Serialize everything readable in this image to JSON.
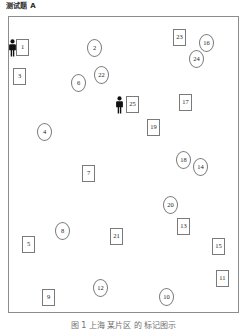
{
  "figure": {
    "title": "测试题 A",
    "caption": "图 1  上海 某片区 的 标记图示",
    "panel": {
      "border_color": "#8d8d8d",
      "background": "#ffffff"
    }
  },
  "persons": [
    {
      "name": "person-left",
      "x": 8,
      "y": 39
    },
    {
      "name": "person-center",
      "x": 115,
      "y": 96
    }
  ],
  "markers": [
    {
      "id": 1,
      "label": "1",
      "shape": "square",
      "x": 16,
      "y": 39
    },
    {
      "id": 2,
      "label": "2",
      "shape": "circle",
      "x": 87,
      "y": 39
    },
    {
      "id": 3,
      "label": "3",
      "shape": "square",
      "x": 13,
      "y": 68
    },
    {
      "id": 4,
      "label": "4",
      "shape": "circle",
      "x": 37,
      "y": 123
    },
    {
      "id": 5,
      "label": "5",
      "shape": "square",
      "x": 22,
      "y": 236
    },
    {
      "id": 6,
      "label": "6",
      "shape": "circle",
      "x": 71,
      "y": 74
    },
    {
      "id": 7,
      "label": "7",
      "shape": "square",
      "x": 82,
      "y": 165
    },
    {
      "id": 8,
      "label": "8",
      "shape": "circle",
      "x": 55,
      "y": 222
    },
    {
      "id": 9,
      "label": "9",
      "shape": "square",
      "x": 42,
      "y": 289
    },
    {
      "id": 10,
      "label": "10",
      "shape": "circle",
      "x": 159,
      "y": 288
    },
    {
      "id": 11,
      "label": "11",
      "shape": "square",
      "x": 216,
      "y": 270
    },
    {
      "id": 12,
      "label": "12",
      "shape": "circle",
      "x": 93,
      "y": 279
    },
    {
      "id": 13,
      "label": "13",
      "shape": "square",
      "x": 177,
      "y": 218
    },
    {
      "id": 14,
      "label": "14",
      "shape": "circle",
      "x": 193,
      "y": 158
    },
    {
      "id": 15,
      "label": "15",
      "shape": "square",
      "x": 212,
      "y": 238
    },
    {
      "id": 16,
      "label": "16",
      "shape": "circle",
      "x": 199,
      "y": 34
    },
    {
      "id": 17,
      "label": "17",
      "shape": "square",
      "x": 179,
      "y": 94
    },
    {
      "id": 18,
      "label": "18",
      "shape": "circle",
      "x": 176,
      "y": 151
    },
    {
      "id": 19,
      "label": "19",
      "shape": "square",
      "x": 147,
      "y": 119
    },
    {
      "id": 20,
      "label": "20",
      "shape": "circle",
      "x": 163,
      "y": 196
    },
    {
      "id": 21,
      "label": "21",
      "shape": "square",
      "x": 110,
      "y": 228
    },
    {
      "id": 22,
      "label": "22",
      "shape": "circle",
      "x": 94,
      "y": 66
    },
    {
      "id": 23,
      "label": "23",
      "shape": "square",
      "x": 173,
      "y": 29
    },
    {
      "id": 24,
      "label": "24",
      "shape": "circle",
      "x": 189,
      "y": 50
    },
    {
      "id": 25,
      "label": "25",
      "shape": "square",
      "x": 126,
      "y": 96
    }
  ]
}
